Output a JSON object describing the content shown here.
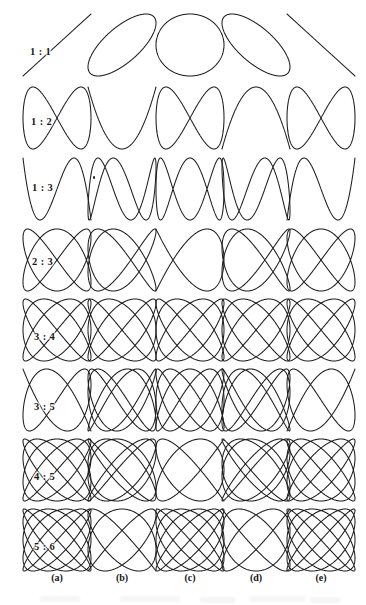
{
  "figure": {
    "kind": "lissajous-plate",
    "background_color": "#ffffff",
    "stroke_color": "#1d1d1d",
    "width": 366,
    "height": 605
  },
  "rows": [
    {
      "label": "1 : 1",
      "a": 1,
      "b": 1,
      "label_x": 30,
      "label_y": 46,
      "center_y": 45
    },
    {
      "label": "1 : 2",
      "a": 1,
      "b": 2,
      "label_x": 31,
      "label_y": 116,
      "center_y": 118
    },
    {
      "label": "1 : 3",
      "a": 1,
      "b": 3,
      "label_x": 32,
      "label_y": 182,
      "center_y": 189
    },
    {
      "label": "2 : 3",
      "a": 2,
      "b": 3,
      "label_x": 32,
      "label_y": 256,
      "center_y": 260
    },
    {
      "label": "3 : 4",
      "a": 3,
      "b": 4,
      "label_x": 34,
      "label_y": 331,
      "center_y": 330
    },
    {
      "label": "3 : 5",
      "a": 3,
      "b": 5,
      "label_x": 34,
      "label_y": 401,
      "center_y": 400
    },
    {
      "label": "4 : 5",
      "a": 4,
      "b": 5,
      "label_x": 34,
      "label_y": 471,
      "center_y": 470
    },
    {
      "label": "5 : 6",
      "a": 5,
      "b": 6,
      "label_x": 34,
      "label_y": 541,
      "center_y": 540
    }
  ],
  "columns": [
    {
      "label": "(a)",
      "phase_fraction": "0",
      "phase": 0.0,
      "center_x": 57,
      "label_x": 37
    },
    {
      "label": "(b)",
      "phase_fraction": "pi/4",
      "phase": 0.7853981634,
      "center_x": 122,
      "label_x": 102
    },
    {
      "label": "(c)",
      "phase_fraction": "pi/2",
      "phase": 1.5707963268,
      "center_x": 190,
      "label_x": 170
    },
    {
      "label": "(d)",
      "phase_fraction": "3pi/4",
      "phase": 2.3561944902,
      "center_x": 256,
      "label_x": 236
    },
    {
      "label": "(e)",
      "phase_fraction": "pi",
      "phase": 3.1415926536,
      "center_x": 321,
      "label_x": 301
    }
  ],
  "cell": {
    "half_width": 34,
    "half_height": 31,
    "stroke_width": 1.05
  },
  "column_label_y": 572,
  "artifacts": {
    "speck": {
      "x": 93,
      "y": 176
    }
  }
}
